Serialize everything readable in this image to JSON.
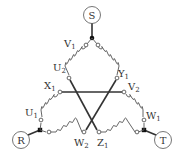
{
  "diagram": {
    "type": "three-phase delta winding connection",
    "terminals": [
      {
        "id": "S",
        "label": "S",
        "x": 92,
        "y": 15
      },
      {
        "id": "R",
        "label": "R",
        "x": 21,
        "y": 140
      },
      {
        "id": "T",
        "label": "T",
        "x": 163,
        "y": 140
      }
    ],
    "winding_ends": {
      "V1": {
        "base": "V",
        "sub": "1"
      },
      "U2": {
        "base": "U",
        "sub": "2"
      },
      "Y1": {
        "base": "Y",
        "sub": "1"
      },
      "X1": {
        "base": "X",
        "sub": "1"
      },
      "V2": {
        "base": "V",
        "sub": "2"
      },
      "U1": {
        "base": "U",
        "sub": "1"
      },
      "W1": {
        "base": "W",
        "sub": "1"
      },
      "W2": {
        "base": "W",
        "sub": "2"
      },
      "Z1": {
        "base": "Z",
        "sub": "1"
      }
    },
    "connections": [
      {
        "from": "X1",
        "to": "V2",
        "style": "straight"
      },
      {
        "from": "U2",
        "to": "Z1",
        "style": "straight-crossing"
      },
      {
        "from": "Y1",
        "to": "W2",
        "style": "straight-crossing"
      }
    ],
    "coils": [
      {
        "from": "V1",
        "to": "U2"
      },
      {
        "from": "X1",
        "to": "U1"
      },
      {
        "from": "S-junction",
        "to": "Y1"
      },
      {
        "from": "V2",
        "to": "W1"
      },
      {
        "from": "R-junction",
        "to": "W2"
      },
      {
        "from": "Z1",
        "to": "T-junction"
      }
    ]
  }
}
